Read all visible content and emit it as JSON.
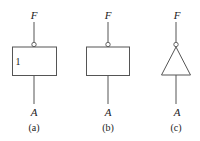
{
  "diagrams": [
    {
      "id": "a",
      "output_label": "F",
      "input_label": "A",
      "caption": "(a)",
      "inner_text": "1",
      "shape": "rectangle"
    },
    {
      "id": "b",
      "output_label": "F",
      "input_label": "A",
      "caption": "(b)",
      "inner_text": "",
      "shape": "rectangle"
    },
    {
      "id": "c",
      "output_label": "F",
      "input_label": "A",
      "caption": "(c)",
      "inner_text": "",
      "shape": "triangle"
    }
  ],
  "colors": {
    "stroke": "#555555",
    "text": "#222222",
    "background": "#ffffff"
  }
}
